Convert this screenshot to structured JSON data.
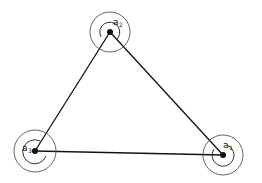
{
  "diagram": {
    "type": "triangle-network",
    "nodes": [
      {
        "id": "a1",
        "label": "a",
        "subscript": "1",
        "x": 223,
        "y": 155,
        "outer_r": 20,
        "inner_r": 11
      },
      {
        "id": "a2",
        "label": "a",
        "subscript": "2",
        "x": 110,
        "y": 32,
        "outer_r": 20,
        "inner_r": 10
      },
      {
        "id": "a3",
        "label": "a",
        "subscript": "3",
        "x": 35,
        "y": 151,
        "outer_r": 21,
        "inner_r": 12
      }
    ],
    "edges": [
      {
        "from": "a2",
        "to": "a3"
      },
      {
        "from": "a2",
        "to": "a1"
      },
      {
        "from": "a3",
        "to": "a1"
      }
    ],
    "colors": {
      "line": "#111111",
      "circle": "#444444",
      "background": "#ffffff"
    }
  }
}
